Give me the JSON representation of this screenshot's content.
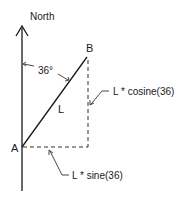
{
  "labels": {
    "north": "North",
    "angle": "36°",
    "point_a": "A",
    "point_b": "B",
    "length": "L",
    "vertical_component": "L * cosine(36)",
    "horizontal_component": "L * sine(36)"
  },
  "colors": {
    "stroke": "#1a1a1a",
    "background": "#ffffff"
  },
  "geometry": {
    "angle_degrees": 36
  }
}
